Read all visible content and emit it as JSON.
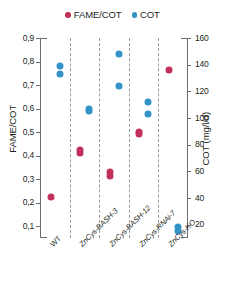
{
  "legend": {
    "entries": [
      {
        "label": "FAME/COT",
        "color": "#C2315A",
        "marker": "circle-dot-red"
      },
      {
        "label": "COT",
        "color": "#3392C7",
        "marker": "circle-dot-blue"
      }
    ]
  },
  "colors": {
    "red": "#C2315A",
    "blue": "#3392C7",
    "axis": "#6d6e71",
    "separator": "#9b9b9b",
    "text": "#231f20",
    "background": "#ffffff"
  },
  "chart_data": {
    "type": "scatter",
    "title": "",
    "xlabel": "",
    "categories": [
      "WT",
      "ZnCys-BASH-3",
      "ZnCys-BASH-12",
      "ZnCys-RNAi-7",
      "ZnCys-KO"
    ],
    "left_axis": {
      "label": "FAME/COT",
      "ticks": [
        "0,1",
        "0,2",
        "0,3",
        "0,4",
        "0,5",
        "0,6",
        "0,7",
        "0,8",
        "0,9"
      ],
      "tick_values": [
        0.1,
        0.2,
        0.3,
        0.4,
        0.5,
        0.6,
        0.7,
        0.8,
        0.9
      ],
      "ylim": [
        0.05,
        0.9
      ]
    },
    "right_axis": {
      "label": "COT (mg/l/d)",
      "ticks": [
        "20",
        "40",
        "60",
        "80",
        "100",
        "120",
        "140",
        "160"
      ],
      "tick_values": [
        20,
        40,
        60,
        80,
        100,
        120,
        140,
        160
      ],
      "ylim": [
        10,
        160
      ]
    },
    "grid": false,
    "legend_position": "top-center",
    "series": [
      {
        "name": "FAME/COT",
        "axis": "left",
        "color": "#C2315A",
        "points": [
          {
            "category": "WT",
            "values": [
              0.225
            ]
          },
          {
            "category": "ZnCys-BASH-3",
            "values": [
              0.425,
              0.413
            ]
          },
          {
            "category": "ZnCys-BASH-12",
            "values": [
              0.33,
              0.315
            ]
          },
          {
            "category": "ZnCys-RNAi-7",
            "values": [
              0.5,
              0.492
            ]
          },
          {
            "category": "ZnCys-KO",
            "values": [
              0.762
            ]
          }
        ]
      },
      {
        "name": "COT",
        "axis": "right",
        "color": "#3392C7",
        "points": [
          {
            "category": "WT",
            "values": [
              139,
              133
            ]
          },
          {
            "category": "ZnCys-BASH-3",
            "values": [
              107,
              105
            ]
          },
          {
            "category": "ZnCys-BASH-12",
            "values": [
              148,
              124
            ]
          },
          {
            "category": "ZnCys-RNAi-7",
            "values": [
              112,
              103
            ]
          },
          {
            "category": "ZnCys-KO",
            "values": [
              18,
              15
            ]
          }
        ]
      }
    ]
  }
}
